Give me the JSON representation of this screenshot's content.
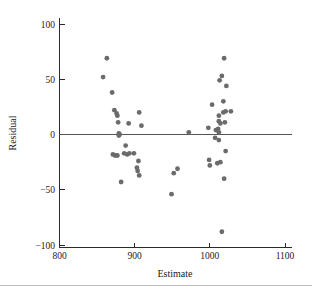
{
  "chart_data": {
    "type": "scatter",
    "title": "",
    "xlabel": "Estimate",
    "ylabel": "Residual",
    "xlim": [
      800,
      1100
    ],
    "ylim": [
      -100,
      100
    ],
    "xticks": [
      800,
      900,
      1000,
      1100
    ],
    "yticks": [
      -100,
      -50,
      0,
      50,
      100
    ],
    "xticklabels": [
      "800",
      "900",
      "1000",
      "1100"
    ],
    "yticklabels": [
      "−100",
      "−50",
      "0",
      "50",
      "100"
    ],
    "grid": false,
    "legend": null,
    "reference_line": {
      "axis": "y",
      "value": 0,
      "color": "#555555"
    },
    "marker": {
      "shape": "circle",
      "size": 2.4,
      "color": "#6b6b6b"
    },
    "points": [
      {
        "x": 858,
        "y": 52
      },
      {
        "x": 863,
        "y": 69
      },
      {
        "x": 870,
        "y": 38
      },
      {
        "x": 873,
        "y": 22
      },
      {
        "x": 876,
        "y": 19
      },
      {
        "x": 877,
        "y": 17
      },
      {
        "x": 878,
        "y": 11
      },
      {
        "x": 879,
        "y": 1
      },
      {
        "x": 879,
        "y": -1
      },
      {
        "x": 880,
        "y": 0
      },
      {
        "x": 871,
        "y": -18
      },
      {
        "x": 877,
        "y": -19
      },
      {
        "x": 874,
        "y": -19
      },
      {
        "x": 882,
        "y": -43
      },
      {
        "x": 886,
        "y": -17
      },
      {
        "x": 890,
        "y": -18
      },
      {
        "x": 893,
        "y": -17
      },
      {
        "x": 888,
        "y": -10
      },
      {
        "x": 892,
        "y": 10
      },
      {
        "x": 899,
        "y": -17
      },
      {
        "x": 906,
        "y": 20
      },
      {
        "x": 909,
        "y": 8
      },
      {
        "x": 905,
        "y": -24
      },
      {
        "x": 903,
        "y": -30
      },
      {
        "x": 904,
        "y": -33
      },
      {
        "x": 906,
        "y": -37
      },
      {
        "x": 952,
        "y": -35
      },
      {
        "x": 957,
        "y": -31
      },
      {
        "x": 949,
        "y": -54
      },
      {
        "x": 972,
        "y": 2
      },
      {
        "x": 998,
        "y": 6
      },
      {
        "x": 1003,
        "y": 27
      },
      {
        "x": 999,
        "y": -23
      },
      {
        "x": 1000,
        "y": -28
      },
      {
        "x": 1013,
        "y": 49
      },
      {
        "x": 1019,
        "y": 69
      },
      {
        "x": 1022,
        "y": 44
      },
      {
        "x": 1016,
        "y": 53
      },
      {
        "x": 1018,
        "y": 30
      },
      {
        "x": 1012,
        "y": 17
      },
      {
        "x": 1018,
        "y": 20
      },
      {
        "x": 1021,
        "y": 21
      },
      {
        "x": 1012,
        "y": 12
      },
      {
        "x": 1014,
        "y": 10
      },
      {
        "x": 1020,
        "y": 11
      },
      {
        "x": 1008,
        "y": 4
      },
      {
        "x": 1011,
        "y": 5
      },
      {
        "x": 1012,
        "y": 2
      },
      {
        "x": 1007,
        "y": -3
      },
      {
        "x": 1012,
        "y": -5
      },
      {
        "x": 1010,
        "y": -26
      },
      {
        "x": 1014,
        "y": -25
      },
      {
        "x": 1021,
        "y": -15
      },
      {
        "x": 1019,
        "y": -40
      },
      {
        "x": 1016,
        "y": -88
      },
      {
        "x": 1028,
        "y": 21
      }
    ]
  },
  "axes": {
    "y_title": "Residual",
    "x_title": "Estimate"
  }
}
